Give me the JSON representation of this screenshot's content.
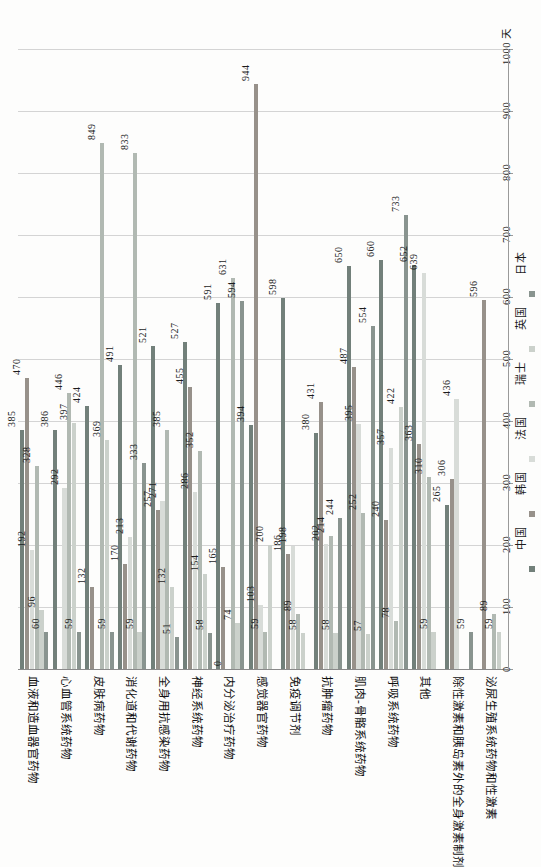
{
  "chart_data": {
    "type": "bar",
    "title": "",
    "note": "clustered column chart rotated 90 degrees counter-clockwise (portrait page layout); value axis on right edge reading bottom-to-top, unit = days",
    "unit_label": "天",
    "ylim": [
      0,
      1000
    ],
    "ytick_step": 100,
    "grid": true,
    "legend_position": "right-column-bottom-to-top",
    "axis_ticks": [
      "0",
      "100",
      "200",
      "300",
      "400",
      "500",
      "600",
      "700",
      "800",
      "900",
      "1000 天"
    ],
    "categories": [
      "血液和造血器官药物",
      "心血管系统药物",
      "皮肤病药物",
      "消化道和代谢药物",
      "全身用抗感染药物",
      "神经系统药物",
      "内分泌治疗药物",
      "感觉器官药物",
      "免疫调节剂",
      "抗肿瘤药物",
      "肌肉-骨骼系统药物",
      "呼吸系统药物",
      "其他",
      "除性激素和胰岛素外的全身激素制剂",
      "泌尿生殖系统药物和性激素"
    ],
    "series": [
      {
        "name": "中国",
        "color": "#72807a",
        "values": [
          385,
          386,
          424,
          491,
          521,
          527,
          591,
          394,
          598,
          380,
          650,
          660,
          652,
          265,
          null
        ]
      },
      {
        "name": "韩国",
        "color": "#97918a",
        "values": [
          470,
          null,
          132,
          170,
          257,
          455,
          165,
          944,
          186,
          431,
          487,
          240,
          363,
          306,
          596
        ]
      },
      {
        "name": "法国",
        "color": "#d8dcd8",
        "values": [
          192,
          292,
          null,
          213,
          271,
          286,
          0,
          103,
          198,
          202,
          395,
          357,
          639,
          436,
          null
        ]
      },
      {
        "name": "瑞士",
        "color": "#b1b9b2",
        "values": [
          328,
          446,
          849,
          833,
          385,
          352,
          631,
          59,
          89,
          214,
          252,
          78,
          310,
          null,
          89
        ]
      },
      {
        "name": "英国",
        "color": "#cbd1cb",
        "values": [
          96,
          397,
          369,
          59,
          132,
          154,
          74,
          200,
          58,
          58,
          57,
          422,
          59,
          null,
          59
        ]
      },
      {
        "name": "日本",
        "color": "#89948f",
        "values": [
          60,
          59,
          59,
          333,
          51,
          58,
          594,
          null,
          null,
          244,
          554,
          733,
          null,
          59,
          null
        ]
      }
    ]
  }
}
